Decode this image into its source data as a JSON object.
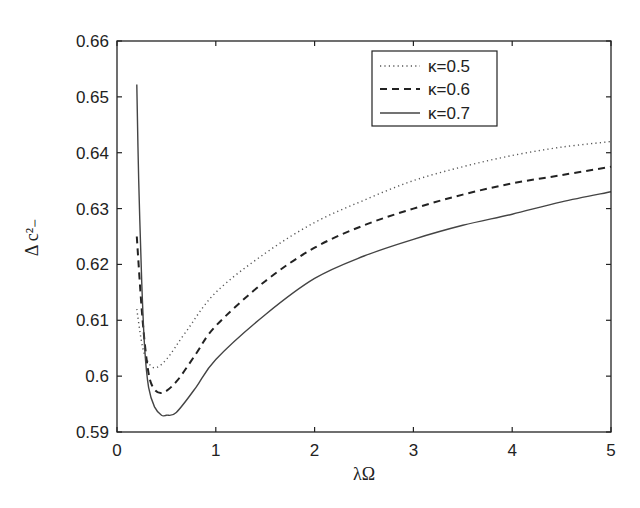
{
  "chart_data": {
    "type": "line",
    "title": "",
    "xlabel": "λΩ",
    "ylabel": "Δ c²₋",
    "xlim": [
      0,
      5
    ],
    "ylim": [
      0.59,
      0.66
    ],
    "xticks": [
      0,
      1,
      2,
      3,
      4,
      5
    ],
    "yticks": [
      0.59,
      0.6,
      0.61,
      0.62,
      0.63,
      0.64,
      0.65,
      0.66
    ],
    "xtick_labels": [
      "0",
      "1",
      "2",
      "3",
      "4",
      "5"
    ],
    "ytick_labels": [
      "0.59",
      "0.6",
      "0.61",
      "0.62",
      "0.63",
      "0.64",
      "0.65",
      "0.66"
    ],
    "grid": false,
    "legend_position": "upper center-right",
    "series": [
      {
        "name": "κ=0.5",
        "style": "dotted",
        "x": [
          0.2,
          0.25,
          0.3,
          0.38,
          0.5,
          0.7,
          1.0,
          1.5,
          2.0,
          2.5,
          3.0,
          3.5,
          4.0,
          4.5,
          5.0
        ],
        "y": [
          0.612,
          0.606,
          0.603,
          0.6015,
          0.603,
          0.608,
          0.615,
          0.622,
          0.6275,
          0.6315,
          0.635,
          0.6375,
          0.6395,
          0.641,
          0.642
        ]
      },
      {
        "name": "κ=0.6",
        "style": "dashed",
        "x": [
          0.2,
          0.25,
          0.3,
          0.35,
          0.45,
          0.6,
          0.8,
          1.0,
          1.5,
          2.0,
          2.5,
          3.0,
          3.5,
          4.0,
          4.5,
          5.0
        ],
        "y": [
          0.625,
          0.612,
          0.603,
          0.5985,
          0.597,
          0.599,
          0.604,
          0.609,
          0.617,
          0.623,
          0.627,
          0.63,
          0.6325,
          0.6345,
          0.636,
          0.6375
        ]
      },
      {
        "name": "κ=0.7",
        "style": "solid",
        "x": [
          0.2,
          0.22,
          0.25,
          0.28,
          0.32,
          0.38,
          0.45,
          0.5,
          0.6,
          0.8,
          1.0,
          1.5,
          2.0,
          2.5,
          3.0,
          3.5,
          4.0,
          4.5,
          5.0
        ],
        "y": [
          0.6522,
          0.635,
          0.617,
          0.605,
          0.598,
          0.5945,
          0.593,
          0.593,
          0.5935,
          0.598,
          0.603,
          0.611,
          0.6175,
          0.6215,
          0.6245,
          0.627,
          0.629,
          0.6312,
          0.633
        ]
      }
    ]
  },
  "legend": {
    "items": [
      {
        "label": "κ=0.5"
      },
      {
        "label": "κ=0.6"
      },
      {
        "label": "κ=0.7"
      }
    ]
  }
}
